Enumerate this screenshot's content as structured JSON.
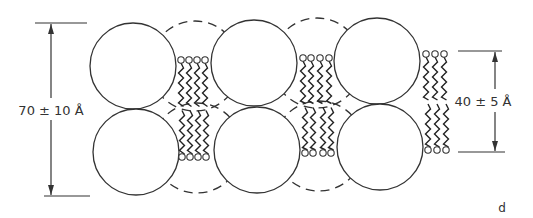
{
  "figure": {
    "panel_label": "d",
    "left_dimension": {
      "label": "70 ± 10 Å",
      "value": "70",
      "pm": "±",
      "uncertainty": "10",
      "unit": "Å"
    },
    "right_dimension": {
      "label": "40 ± 5 Å",
      "value": "40",
      "pm": "±",
      "uncertainty": "5",
      "unit": "Å"
    }
  },
  "diagram": {
    "solid_spheres": [
      {
        "cx": 133,
        "cy": 66,
        "r": 43
      },
      {
        "cx": 136,
        "cy": 152,
        "r": 43
      },
      {
        "cx": 254,
        "cy": 63,
        "r": 43
      },
      {
        "cx": 257,
        "cy": 150,
        "r": 43
      },
      {
        "cx": 377,
        "cy": 61,
        "r": 43
      },
      {
        "cx": 380,
        "cy": 147,
        "r": 43
      }
    ],
    "dashed_spheres": [
      {
        "cx": 195,
        "cy": 66,
        "r": 45
      },
      {
        "cx": 197,
        "cy": 148,
        "r": 45
      },
      {
        "cx": 317,
        "cy": 63,
        "r": 45
      },
      {
        "cx": 319,
        "cy": 146,
        "r": 45
      }
    ],
    "lipid_groups": [
      {
        "top_heads_x": [
          181,
          189,
          197,
          205
        ],
        "top_y": 60,
        "bottom_heads_x": [
          182,
          190,
          198,
          206
        ],
        "bottom_y": 157
      },
      {
        "top_heads_x": [
          303,
          311,
          320,
          329
        ],
        "top_y": 58,
        "bottom_heads_x": [
          305,
          313,
          323,
          331
        ],
        "bottom_y": 153
      },
      {
        "top_heads_x": [
          426,
          435,
          444
        ],
        "top_y": 54,
        "bottom_heads_x": [
          428,
          437,
          446
        ],
        "bottom_y": 150
      }
    ]
  }
}
